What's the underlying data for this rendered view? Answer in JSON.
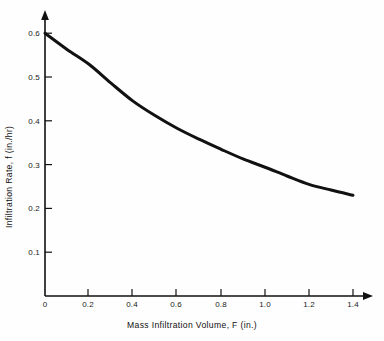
{
  "figure": {
    "background_color": "#fefefe",
    "ink_color": "#111111"
  },
  "chart_data": {
    "type": "line",
    "title": "",
    "subtitle": "",
    "xlabel": "Mass Infiltration Volume, F (in.)",
    "ylabel": "Infiltration Rate, f (in./hr)",
    "xlim": [
      0,
      1.45
    ],
    "ylim": [
      0,
      0.62
    ],
    "grid": false,
    "legend": null,
    "legend_position": "none",
    "annotations": [],
    "x_ticks": [
      0,
      0.2,
      0.4,
      0.6,
      0.8,
      1.0,
      1.2,
      1.4
    ],
    "x_tick_labels": [
      "0",
      "0.2",
      "0.4",
      "0.6",
      "0.8",
      "1.0",
      "1.2",
      "1.4"
    ],
    "y_ticks": [
      0.1,
      0.2,
      0.3,
      0.4,
      0.5,
      0.6
    ],
    "y_tick_labels": [
      "0.1",
      "0.2",
      "0.3",
      "0.4",
      "0.5",
      "0.6"
    ],
    "axis_style": "arrow-tipped open axes",
    "series": [
      {
        "name": "Infiltration rate curve",
        "color": "#111111",
        "line_width": 3,
        "x": [
          0.0,
          0.1,
          0.2,
          0.3,
          0.4,
          0.5,
          0.6,
          0.7,
          0.8,
          0.9,
          1.0,
          1.1,
          1.2,
          1.3,
          1.4
        ],
        "values": [
          0.6,
          0.563,
          0.529,
          0.486,
          0.445,
          0.412,
          0.383,
          0.358,
          0.335,
          0.313,
          0.294,
          0.274,
          0.255,
          0.242,
          0.23
        ]
      }
    ]
  }
}
